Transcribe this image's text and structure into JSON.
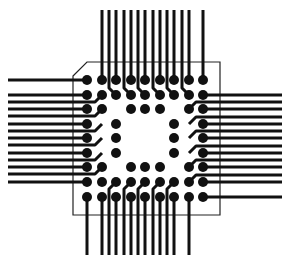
{
  "colors": {
    "background": "#ffffff",
    "trace": "#111111",
    "pad": "#111111",
    "outline": "#222222"
  },
  "grid": {
    "columns_x": [
      87,
      102,
      116,
      131,
      145,
      160,
      174,
      189,
      203
    ],
    "rows_y": [
      80,
      95,
      109,
      124,
      138,
      153,
      167,
      182,
      197
    ],
    "pad_radius": 5,
    "trace_width": 3
  },
  "package_outline": {
    "left": 73,
    "top": 62,
    "right": 220,
    "bottom": 215,
    "chamfer": 14
  },
  "pads": [
    "111111111",
    "111111111",
    "110111011",
    "101000101",
    "101000101",
    "101000101",
    "110111011",
    "111111111",
    "111111111"
  ],
  "fanout": {
    "top_end_y": 10,
    "bottom_end_y": 255,
    "left_end_x": 8,
    "right_end_x": 282,
    "jog": 7
  }
}
